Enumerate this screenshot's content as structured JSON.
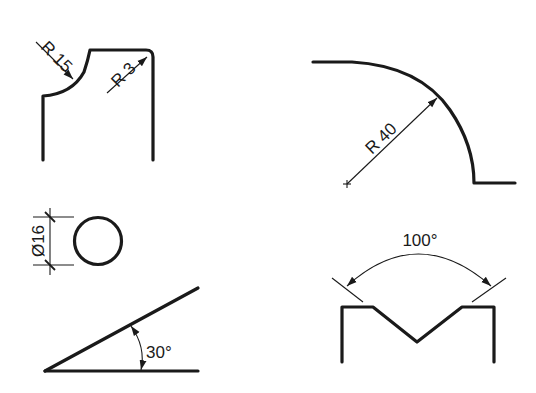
{
  "figures": {
    "corner_radii": {
      "large_radius_label": "R 15",
      "small_radius_label": "R 3"
    },
    "large_arc": {
      "radius_label": "R 40"
    },
    "circle": {
      "diameter_label": "Ø16"
    },
    "incline": {
      "angle_label": "30°"
    },
    "v_groove": {
      "angle_label": "100°"
    }
  },
  "colors": {
    "line": "#1a1a1a",
    "background": "#ffffff"
  }
}
